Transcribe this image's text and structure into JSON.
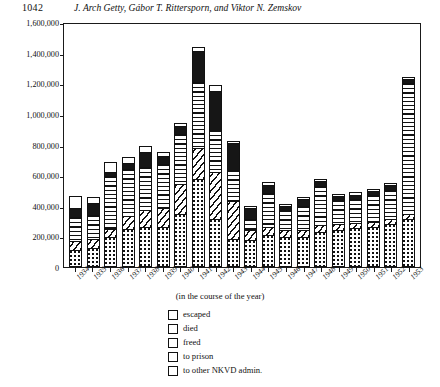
{
  "page": {
    "folio": "1042",
    "running_head": "J. Arch Getty, Gábor T. Rittersporn, and Viktor N. Zemskov"
  },
  "figure": {
    "axis_caption": "(in the course of the year)",
    "caption": "",
    "y_ticks": [
      "0",
      "200,000",
      "400,000",
      "600,000",
      "800,000",
      "1,000,000",
      "1,200,000",
      "1,400,000",
      "1,600,000"
    ]
  },
  "legend": {
    "items": [
      {
        "label": "escaped",
        "pattern": "white",
        "color": "#ffffff"
      },
      {
        "label": "died",
        "pattern": "solid",
        "color": "#161616"
      },
      {
        "label": "freed",
        "pattern": "horiz",
        "color": "#ffffff"
      },
      {
        "label": "to prison",
        "pattern": "diag",
        "color": "#ffffff"
      },
      {
        "label": "to other NKVD admin.",
        "pattern": "dots",
        "color": "#ffffff"
      }
    ]
  },
  "chart_data": {
    "type": "bar",
    "stacked": true,
    "title": "",
    "xlabel": "(in the course of the year)",
    "ylabel": "",
    "ylim": [
      0,
      1600000
    ],
    "ytick_step": 200000,
    "grid": false,
    "legend_position": "below",
    "categories": [
      "1934",
      "1935",
      "1936",
      "1937",
      "1938",
      "1939",
      "1940",
      "1941",
      "1942",
      "1943",
      "1944",
      "1945",
      "1946",
      "1947",
      "1948",
      "1949",
      "1950",
      "1951",
      "1952",
      "1953"
    ],
    "series": [
      {
        "name": "to other NKVD admin.",
        "pattern": "dots",
        "values": [
          95000,
          110000,
          185000,
          235000,
          245000,
          250000,
          330000,
          560000,
          300000,
          170000,
          165000,
          195000,
          185000,
          185000,
          215000,
          230000,
          240000,
          250000,
          270000,
          300000
        ]
      },
      {
        "name": "to prison",
        "pattern": "diag",
        "values": [
          55000,
          55000,
          45000,
          80000,
          110000,
          115000,
          190000,
          200000,
          300000,
          240000,
          55000,
          45000,
          35000,
          35000,
          40000,
          30000,
          25000,
          25000,
          25000,
          25000
        ]
      },
      {
        "name": "freed",
        "pattern": "horiz",
        "values": [
          150000,
          150000,
          335000,
          300000,
          275000,
          280000,
          320000,
          420000,
          270000,
          200000,
          70000,
          220000,
          125000,
          155000,
          250000,
          150000,
          150000,
          170000,
          185000,
          850000
        ]
      },
      {
        "name": "died",
        "pattern": "solid",
        "values": [
          55000,
          70000,
          25000,
          30000,
          90000,
          50000,
          45000,
          200000,
          250000,
          165000,
          60000,
          45000,
          20000,
          35000,
          25000,
          20000,
          25000,
          20000,
          20000,
          20000
        ]
      },
      {
        "name": "escaped",
        "pattern": "white",
        "values": [
          70000,
          35000,
          55000,
          35000,
          30000,
          20000,
          15000,
          20000,
          30000,
          10000,
          10000,
          10000,
          5000,
          5000,
          5000,
          5000,
          5000,
          5000,
          5000,
          5000
        ]
      }
    ]
  }
}
